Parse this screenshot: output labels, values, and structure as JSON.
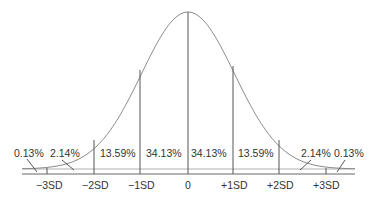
{
  "chart_data": {
    "type": "area",
    "title": "",
    "xlabel": "",
    "ylabel": "",
    "categories": [
      "-3SD",
      "-2SD",
      "-1SD",
      "0",
      "+1SD",
      "+2SD",
      "+3SD"
    ],
    "tick_labels": [
      "−3SD",
      "−2SD",
      "−1SD",
      "0",
      "+1SD",
      "+2SD",
      "+3SD"
    ],
    "regions": [
      {
        "range": "< -3SD",
        "label": "0.13%",
        "value": 0.13
      },
      {
        "range": "-3SD to -2SD",
        "label": "2.14%",
        "value": 2.14
      },
      {
        "range": "-2SD to -1SD",
        "label": "13.59%",
        "value": 13.59
      },
      {
        "range": "-1SD to 0",
        "label": "34.13%",
        "value": 34.13
      },
      {
        "range": "0 to +1SD",
        "label": "34.13%",
        "value": 34.13
      },
      {
        "range": "+1SD to +2SD",
        "label": "13.59%",
        "value": 13.59
      },
      {
        "range": "+2SD to +3SD",
        "label": "2.14%",
        "value": 2.14
      },
      {
        "range": "> +3SD",
        "label": "0.13%",
        "value": 0.13
      }
    ],
    "xlim": [
      -3.3,
      3.3
    ],
    "grid": false,
    "legend": "none"
  },
  "labels": {
    "pct_far_left": "0.13%",
    "pct_left_2": "2.14%",
    "pct_left_1": "13.59%",
    "pct_left_0": "34.13%",
    "pct_right_0": "34.13%",
    "pct_right_1": "13.59%",
    "pct_right_2": "2.14%",
    "pct_far_right": "0.13%",
    "tick_m3": "−3SD",
    "tick_m2": "−2SD",
    "tick_m1": "−1SD",
    "tick_0": "0",
    "tick_p1": "+1SD",
    "tick_p2": "+2SD",
    "tick_p3": "+3SD"
  },
  "colors": {
    "curve": "#8a8a8a",
    "lines": "#555555",
    "text": "#333333",
    "background": "#ffffff"
  }
}
